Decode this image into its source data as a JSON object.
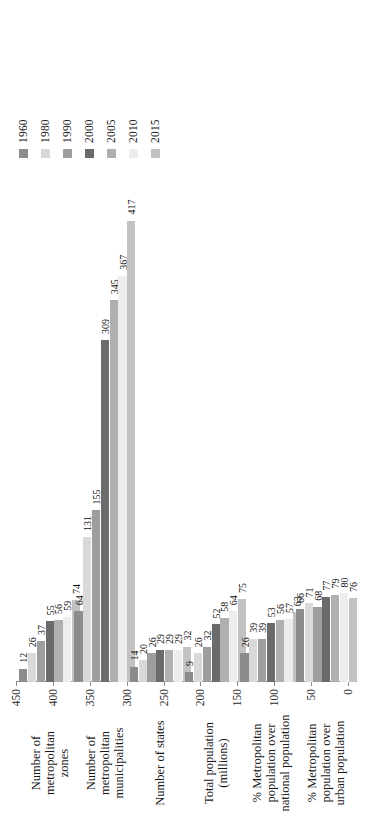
{
  "chart_data": {
    "type": "bar",
    "orientation": "horizontal",
    "title": "",
    "xlabel": "",
    "ylabel": "",
    "xlim": [
      0,
      450
    ],
    "xticks": [
      0,
      50,
      100,
      150,
      200,
      250,
      300,
      350,
      400,
      450
    ],
    "grid": false,
    "legend_position": "top-right",
    "categories": [
      "Number of metropolitan zones",
      "Number of metropolitan municipalities",
      "Number of states",
      "Total population (millions)",
      "% Metropolitan population over national population",
      "% Metropolitan population over urban population"
    ],
    "series": [
      {
        "name": "1960",
        "color": "#8c8c8c",
        "values": [
          12,
          64,
          14,
          9,
          26,
          66
        ]
      },
      {
        "name": "1980",
        "color": "#d9d9d9",
        "values": [
          26,
          131,
          20,
          26,
          39,
          71
        ]
      },
      {
        "name": "1990",
        "color": "#9e9e9e",
        "values": [
          37,
          155,
          26,
          32,
          39,
          68
        ]
      },
      {
        "name": "2000",
        "color": "#6b6b6b",
        "values": [
          55,
          309,
          29,
          52,
          53,
          77
        ]
      },
      {
        "name": "2005",
        "color": "#b0b0b0",
        "values": [
          56,
          345,
          29,
          58,
          56,
          79
        ]
      },
      {
        "name": "2010",
        "color": "#ededed",
        "values": [
          59,
          367,
          29,
          64,
          57,
          80
        ]
      },
      {
        "name": "2015",
        "color": "#c2c2c2",
        "values": [
          74,
          417,
          32,
          75,
          63,
          76
        ]
      }
    ]
  },
  "legend": {
    "items": [
      {
        "label": "1960",
        "color": "#8c8c8c"
      },
      {
        "label": "1980",
        "color": "#d9d9d9"
      },
      {
        "label": "1990",
        "color": "#9e9e9e"
      },
      {
        "label": "2000",
        "color": "#6b6b6b"
      },
      {
        "label": "2005",
        "color": "#b0b0b0"
      },
      {
        "label": "2010",
        "color": "#ededed"
      },
      {
        "label": "2015",
        "color": "#c2c2c2"
      }
    ]
  },
  "axis": {
    "tick_labels": [
      "450",
      "400",
      "350",
      "300",
      "250",
      "200",
      "150",
      "100",
      "50",
      "0"
    ]
  },
  "groups": [
    {
      "caption": "Number of\nmetropolitan\nzones",
      "values": [
        12,
        26,
        37,
        55,
        56,
        59,
        74
      ],
      "labels": [
        "12",
        "26",
        "37",
        "55",
        "56",
        "59",
        "74"
      ]
    },
    {
      "caption": "Number of\nmetropolitan\nmunicipalities",
      "values": [
        64,
        131,
        155,
        309,
        345,
        367,
        417
      ],
      "labels": [
        "64",
        "131",
        "155",
        "309",
        "345",
        "367",
        "417"
      ]
    },
    {
      "caption": "Number of states",
      "values": [
        14,
        20,
        26,
        29,
        29,
        29,
        32
      ],
      "labels": [
        "14",
        "20",
        "26",
        "29",
        "29",
        "29",
        "32"
      ]
    },
    {
      "caption": "Total population\n(millions)",
      "values": [
        9,
        26,
        32,
        52,
        58,
        64,
        75
      ],
      "labels": [
        "9",
        "26",
        "32",
        "52",
        "58",
        "64",
        "75"
      ]
    },
    {
      "caption": "% Metropolitan\npopulation over\nnational population",
      "values": [
        26,
        39,
        39,
        53,
        56,
        57,
        63
      ],
      "labels": [
        "26",
        "39",
        "39",
        "53",
        "56",
        "57",
        "63"
      ]
    },
    {
      "caption": "% Metropolitan\npopulation over\nurban population",
      "values": [
        66,
        71,
        68,
        77,
        79,
        80,
        76
      ],
      "labels": [
        "66",
        "71",
        "68",
        "77",
        "79",
        "80",
        "76"
      ]
    }
  ]
}
